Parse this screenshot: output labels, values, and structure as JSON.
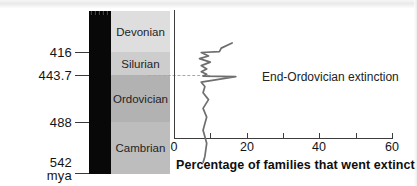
{
  "figure": {
    "caption_axis_x": "Percentage of families that went extinct",
    "age_unit_label": "mya"
  },
  "age_axis": {
    "unit": "mya",
    "ticks": [
      {
        "value": "416",
        "y": 52.5
      },
      {
        "value": "443.7",
        "y": 75.5
      },
      {
        "value": "488",
        "y": 122.0
      },
      {
        "value": "542",
        "y": 162.5
      }
    ]
  },
  "periods": [
    {
      "name": "Devonian",
      "top_mya": 416,
      "base_mya": 443.7,
      "color": "#dedede"
    },
    {
      "name": "Silurian",
      "top_mya": 443.7,
      "base_mya": 488,
      "color": "#cdcdcd"
    },
    {
      "name": "Ordovician",
      "top_mya": 488,
      "base_mya": 542,
      "color": "#b2b2b2"
    },
    {
      "name": "Cambrian",
      "top_mya": 542,
      "base_mya": 542,
      "color": "#bdbdbd"
    }
  ],
  "annotation": {
    "label": "End-Ordovician extinction",
    "at_percent": 17,
    "at_mya": 443.7
  },
  "chart_data": {
    "type": "line",
    "title": "",
    "xlabel": "Percentage of families that went extinct",
    "ylabel": "mya",
    "xlim": [
      0,
      60
    ],
    "ylim": [
      542,
      400
    ],
    "xticks": [
      0,
      10,
      20,
      30,
      40,
      50,
      60
    ],
    "xtick_labels": [
      "0",
      "",
      "20",
      "",
      "40",
      "",
      "60"
    ],
    "yticks": [
      416,
      443.7,
      488,
      542
    ],
    "grid": false,
    "legend": null,
    "orientation": "vertical-time-axis",
    "series": [
      {
        "name": "Percentage of families that went extinct",
        "color": "#6e6e6e",
        "points": [
          {
            "mya": 405.0,
            "percent": 16.0
          },
          {
            "mya": 411.0,
            "percent": 13.0
          },
          {
            "mya": 415.0,
            "percent": 12.5
          },
          {
            "mya": 416.0,
            "percent": 7.5
          },
          {
            "mya": 420.0,
            "percent": 9.5
          },
          {
            "mya": 423.0,
            "percent": 7.0
          },
          {
            "mya": 427.0,
            "percent": 10.0
          },
          {
            "mya": 431.0,
            "percent": 7.5
          },
          {
            "mya": 435.0,
            "percent": 9.0
          },
          {
            "mya": 438.0,
            "percent": 7.5
          },
          {
            "mya": 441.0,
            "percent": 9.0
          },
          {
            "mya": 443.0,
            "percent": 8.0
          },
          {
            "mya": 443.7,
            "percent": 17.0
          },
          {
            "mya": 450.0,
            "percent": 7.5
          },
          {
            "mya": 455.0,
            "percent": 8.5
          },
          {
            "mya": 462.0,
            "percent": 8.0
          },
          {
            "mya": 470.0,
            "percent": 9.5
          },
          {
            "mya": 480.0,
            "percent": 8.0
          },
          {
            "mya": 490.0,
            "percent": 9.0
          },
          {
            "mya": 505.0,
            "percent": 8.0
          },
          {
            "mya": 520.0,
            "percent": 9.0
          },
          {
            "mya": 535.0,
            "percent": 8.5
          },
          {
            "mya": 542.0,
            "percent": 8.0
          }
        ]
      }
    ]
  }
}
